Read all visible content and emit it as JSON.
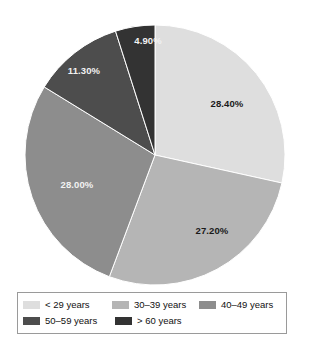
{
  "chart_data": {
    "type": "pie",
    "title": "",
    "subtitle": "",
    "xlabel": "",
    "ylabel": "",
    "grid": false,
    "legend_position": "bottom",
    "start_angle_deg": 0,
    "direction": "clockwise",
    "categories": [
      "< 29 years",
      "30–39 years",
      "40–49 years",
      "50–59 years",
      "> 60 years"
    ],
    "values": [
      28.4,
      27.2,
      28.0,
      11.3,
      4.9
    ],
    "data_labels": [
      "28.40%",
      "27.20%",
      "28.00%",
      "11.30%",
      "4.90%"
    ],
    "colors": [
      "#dedede",
      "#b5b5b5",
      "#8d8d8d",
      "#4d4d4d",
      "#333333"
    ],
    "label_text_colors": [
      "#1a1a1a",
      "#1a1a1a",
      "#f2f2f2",
      "#f2f2f2",
      "#f2f2f2"
    ],
    "slices": [
      {
        "label": "< 29 years",
        "value": 28.4,
        "data_label": "28.40%",
        "color": "#dedede",
        "label_color": "dark"
      },
      {
        "label": "30–39 years",
        "value": 27.2,
        "data_label": "27.20%",
        "color": "#b5b5b5",
        "label_color": "dark"
      },
      {
        "label": "40–49 years",
        "value": 28.0,
        "data_label": "28.00%",
        "color": "#8d8d8d",
        "label_color": "light"
      },
      {
        "label": "50–59 years",
        "value": 11.3,
        "data_label": "11.30%",
        "color": "#4d4d4d",
        "label_color": "light"
      },
      {
        "label": "> 60 years",
        "value": 4.9,
        "data_label": "4.90%",
        "color": "#333333",
        "label_color": "light"
      }
    ]
  },
  "pie": {
    "center_x": 155,
    "center_y": 155,
    "radius": 130,
    "labels": [
      {
        "text": "28.40%",
        "x": 227,
        "y": 107,
        "tone": "dark"
      },
      {
        "text": "27.20%",
        "x": 212,
        "y": 234,
        "tone": "dark"
      },
      {
        "text": "28.00%",
        "x": 77,
        "y": 188,
        "tone": "light"
      },
      {
        "text": "11.30%",
        "x": 84,
        "y": 74,
        "tone": "light"
      },
      {
        "text": "4.90%",
        "x": 148,
        "y": 44,
        "tone": "light"
      }
    ]
  },
  "legend": {
    "rows": [
      [
        {
          "label": "< 29 years",
          "color": "#dedede"
        },
        {
          "label": "30–39 years",
          "color": "#b5b5b5"
        },
        {
          "label": "40–49 years",
          "color": "#8d8d8d"
        }
      ],
      [
        {
          "label": "50–59 years",
          "color": "#4d4d4d"
        },
        {
          "label": "> 60 years",
          "color": "#333333"
        }
      ]
    ]
  },
  "style": {
    "background": "#ffffff",
    "legend_border": "#9a9a9a",
    "slice_outline": "#ffffff"
  }
}
